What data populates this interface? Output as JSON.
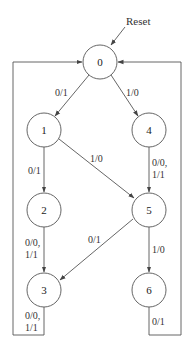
{
  "diagram": {
    "type": "state-machine",
    "reset_label": "Reset",
    "states": [
      {
        "id": "0",
        "label": "0",
        "cx": 100,
        "cy": 62
      },
      {
        "id": "1",
        "label": "1",
        "cx": 44,
        "cy": 130
      },
      {
        "id": "4",
        "label": "4",
        "cx": 149,
        "cy": 130
      },
      {
        "id": "2",
        "label": "2",
        "cx": 44,
        "cy": 210
      },
      {
        "id": "5",
        "label": "5",
        "cx": 149,
        "cy": 210
      },
      {
        "id": "3",
        "label": "3",
        "cx": 44,
        "cy": 290
      },
      {
        "id": "6",
        "label": "6",
        "cx": 149,
        "cy": 290
      }
    ],
    "transitions": [
      {
        "from": "0",
        "to": "1",
        "label": "0/1"
      },
      {
        "from": "0",
        "to": "4",
        "label": "1/0"
      },
      {
        "from": "1",
        "to": "2",
        "label": "0/1"
      },
      {
        "from": "1",
        "to": "5",
        "label": "1/0"
      },
      {
        "from": "4",
        "to": "5",
        "label_line1": "0/0,",
        "label_line2": "1/1"
      },
      {
        "from": "2",
        "to": "3",
        "label_line1": "0/0,",
        "label_line2": "1/1"
      },
      {
        "from": "5",
        "to": "3",
        "label": "0/1"
      },
      {
        "from": "5",
        "to": "6",
        "label": "1/0"
      },
      {
        "from": "3",
        "to": "0",
        "label_line1": "0/0,",
        "label_line2": "1/1"
      },
      {
        "from": "6",
        "to": "0",
        "label": "0/1"
      }
    ]
  }
}
